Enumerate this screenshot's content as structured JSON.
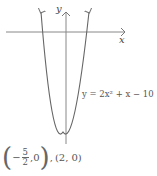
{
  "graph": {
    "x_axis_label": "x",
    "y_axis_label": "y",
    "equation_label": "y = 2x² + x − 10",
    "equation": {
      "a": 2,
      "b": 1,
      "c": -10
    },
    "roots": [
      [
        -2.5,
        0
      ],
      [
        2,
        0
      ]
    ],
    "vertex": [
      -0.25,
      -10.125
    ],
    "colors": {
      "axis": "#777777",
      "curve": "#666666",
      "text": "#555555"
    }
  },
  "answer": {
    "prefix_minus": "−",
    "frac_num": "5",
    "frac_den": "2",
    "first_point_y": "0",
    "separator": ",",
    "second_point": "(2, 0)"
  }
}
